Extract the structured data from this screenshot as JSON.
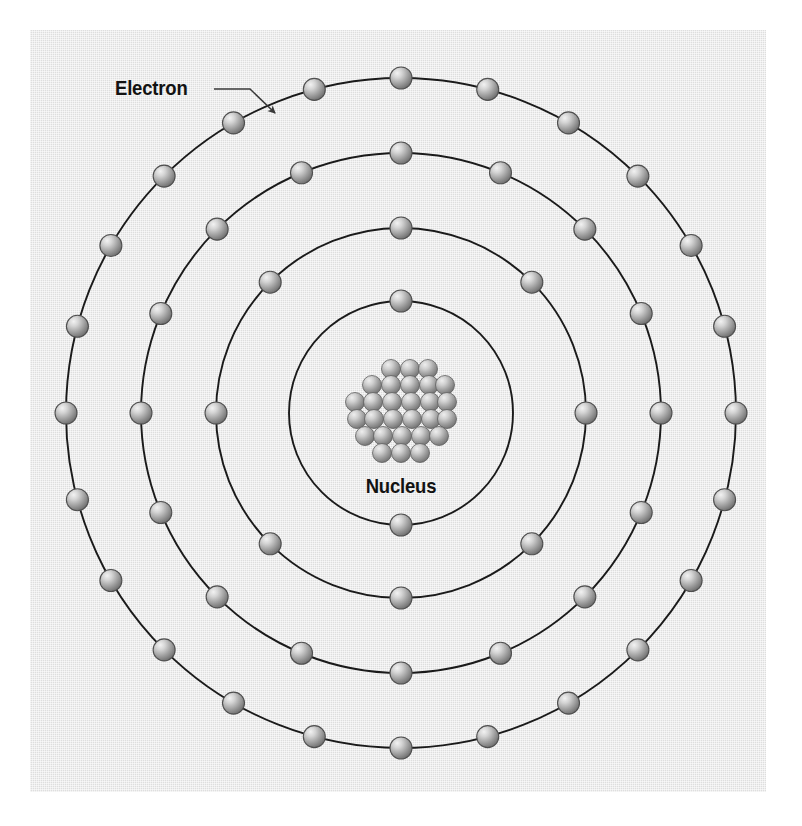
{
  "figure": {
    "kind": "bohr-atom-model",
    "background_color": "#e3e3e3",
    "page_color": "#ffffff",
    "line_color": "#1a1a1a",
    "electron_fill_light": "#e8e8e8",
    "electron_fill_dark": "#6f6f6f",
    "label_color": "#121212"
  },
  "labels": {
    "electron": "Electron",
    "nucleus": "Nucleus"
  },
  "chart_data": {
    "type": "diagram",
    "title": "",
    "center": {
      "x": 401,
      "y": 413
    },
    "nucleus": {
      "label": "Nucleus",
      "particle_count": 26,
      "particle_radius": 9.5,
      "cluster_radius": 52,
      "rows": [
        {
          "y": -44,
          "xs": [
            -10,
            9,
            27
          ]
        },
        {
          "y": -28,
          "xs": [
            -29,
            -10,
            9,
            28,
            44
          ]
        },
        {
          "y": -11,
          "xs": [
            -46,
            -28,
            -9,
            10,
            29,
            46
          ]
        },
        {
          "y": 6,
          "xs": [
            -44,
            -27,
            -8,
            11,
            30,
            46
          ]
        },
        {
          "y": 23,
          "xs": [
            -36,
            -18,
            1,
            20,
            38
          ]
        },
        {
          "y": 40,
          "xs": [
            -19,
            0,
            19
          ]
        }
      ]
    },
    "shells": [
      {
        "index": 1,
        "radius": 112,
        "electron_count": 2,
        "start_angle_deg": -90
      },
      {
        "index": 2,
        "radius": 185,
        "electron_count": 8,
        "start_angle_deg": -90
      },
      {
        "index": 3,
        "radius": 260,
        "electron_count": 16,
        "start_angle_deg": -90
      },
      {
        "index": 4,
        "radius": 335,
        "electron_count": 24,
        "start_angle_deg": -90
      }
    ],
    "electron_radius": 11,
    "annotation": {
      "text": "Electron",
      "target_shell": 4,
      "target_angle_deg": -116,
      "leader": {
        "x1": 214,
        "y1": 89,
        "x2": 250,
        "y2": 89,
        "x3": 275,
        "y3": 113
      }
    }
  }
}
